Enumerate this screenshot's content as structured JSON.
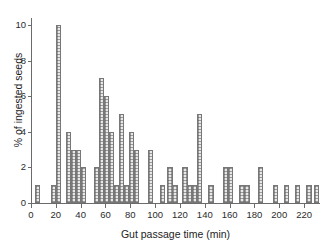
{
  "chart_data": {
    "type": "bar",
    "title": "",
    "subtitle": "",
    "xlabel": "Gut passage time (min)",
    "ylabel": "% of ingested seeds",
    "xlim": [
      0,
      232
    ],
    "ylim": [
      0,
      10.4
    ],
    "xticks": [
      0,
      20,
      40,
      60,
      80,
      100,
      120,
      140,
      160,
      180,
      200,
      220
    ],
    "yticks": [
      0,
      2,
      4,
      6,
      8,
      10
    ],
    "grid": false,
    "legend": null,
    "bin_width": 4.2,
    "bar_fill": "#e9e9e9",
    "bar_edge": "#777777",
    "axis_color": "#6b6b6b",
    "categories": [
      5,
      18,
      22,
      30,
      34,
      38,
      42,
      53,
      57,
      61,
      65,
      69,
      73,
      77,
      81,
      85,
      96,
      106,
      112,
      116,
      124,
      128,
      132,
      136,
      145,
      157,
      161,
      170,
      174,
      185,
      197,
      206,
      215,
      224,
      230
    ],
    "values": [
      1,
      1,
      10,
      4,
      3,
      3,
      2,
      2,
      7,
      6,
      4,
      1,
      5,
      1,
      4,
      3,
      3,
      1,
      2,
      1,
      2,
      1,
      1,
      5,
      1,
      2,
      2,
      1,
      1,
      2,
      1,
      1,
      1,
      1,
      1
    ],
    "series": [
      {
        "name": "% of ingested seeds",
        "values": [
          1,
          1,
          10,
          4,
          3,
          3,
          2,
          2,
          7,
          6,
          4,
          1,
          5,
          1,
          4,
          3,
          3,
          1,
          2,
          1,
          2,
          1,
          1,
          5,
          1,
          2,
          2,
          1,
          1,
          2,
          1,
          1,
          1,
          1,
          1
        ]
      }
    ]
  }
}
